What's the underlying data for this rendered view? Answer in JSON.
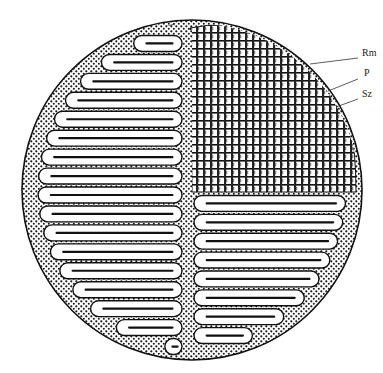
{
  "figure": {
    "type": "histological cross-section illustration",
    "colors": {
      "ink": "#111111",
      "paper": "#ffffff",
      "stipple": "#1a1a1a"
    },
    "circle": {
      "cx": 192,
      "cy": 190,
      "r": 170
    },
    "left_lamellae_count": 17,
    "right_lamellae_count": 8,
    "labels": [
      {
        "id": "rm",
        "text": "Rm",
        "x": 362,
        "y": 55,
        "line": [
          310,
          64,
          358,
          58
        ]
      },
      {
        "id": "p",
        "text": "P",
        "x": 362,
        "y": 75,
        "line": [
          328,
          91,
          358,
          79
        ]
      },
      {
        "id": "sz",
        "text": "Sz",
        "x": 362,
        "y": 96,
        "line": [
          336,
          107,
          358,
          99
        ]
      }
    ]
  }
}
